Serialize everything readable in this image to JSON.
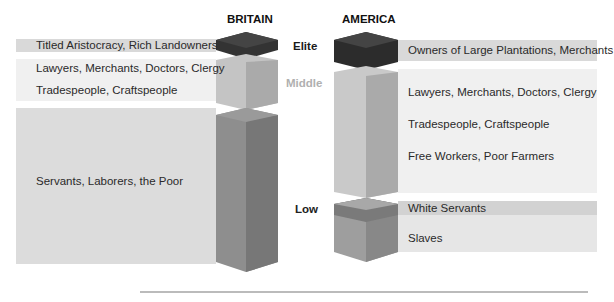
{
  "headers": {
    "britain": "BRITAIN",
    "america": "AMERICA"
  },
  "classes": {
    "elite": {
      "label": "Elite",
      "color": "#1a1a1a"
    },
    "middle": {
      "label": "Middle",
      "color": "#b0b0b0"
    },
    "low": {
      "label": "Low",
      "color": "#222222"
    }
  },
  "britain": {
    "elite": [
      "Titled Aristocracy, Rich Landowners"
    ],
    "middle": [
      "Lawyers, Merchants, Doctors, Clergy",
      "Tradespeople, Craftspeople"
    ],
    "low": [
      "Servants, Laborers, the Poor"
    ]
  },
  "america": {
    "elite": [
      "Owners of Large Plantations, Merchants"
    ],
    "middle": [
      "Lawyers, Merchants, Doctors, Clergy",
      "Tradespeople, Craftspeople",
      "Free Workers, Poor Farmers"
    ],
    "low": [
      "White Servants",
      "Slaves"
    ]
  },
  "colors": {
    "elite_block": "#2a2a2a",
    "middle_block": "#bdbdbd",
    "low_block": "#8a8a8a",
    "band_light": "#efefef",
    "band_dark": "#d6d6d6"
  }
}
